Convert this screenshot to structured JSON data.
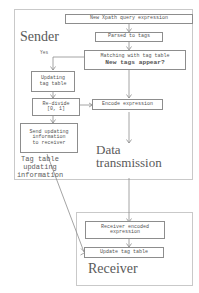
{
  "diagram": {
    "title_sender": "Sender",
    "title_receiver": "Receiver",
    "title_transmission": "Data\ntransmission",
    "edge_label_yes": "Yes",
    "edge_label_tagtable": "Tag table\nupdating\ninformation",
    "colors": {
      "box_border": "#8d8d8d",
      "frame_border": "#c9c9c9",
      "text": "#545454",
      "wire": "#8d8d8d",
      "background": "#ffffff"
    },
    "nodes": [
      {
        "id": "new-xpath",
        "label": "New Xpath query expression"
      },
      {
        "id": "parsed-to-tags",
        "label": "Parsed to tags"
      },
      {
        "id": "matching-line1",
        "label": "Matching with tag table"
      },
      {
        "id": "matching-line2",
        "label": "New tags appear?"
      },
      {
        "id": "updating-tag",
        "label": "Updating\ntag table"
      },
      {
        "id": "re-divide",
        "label": "Re-divide\n[0, 1]"
      },
      {
        "id": "encode-expr",
        "label": "Encode expression"
      },
      {
        "id": "send-updating",
        "label": "Send updating\ninformation\nto receiver"
      },
      {
        "id": "receiver-encoded",
        "label": "Receiver encoded\nexpression"
      },
      {
        "id": "update-tag",
        "label": "Update tag table"
      }
    ]
  }
}
